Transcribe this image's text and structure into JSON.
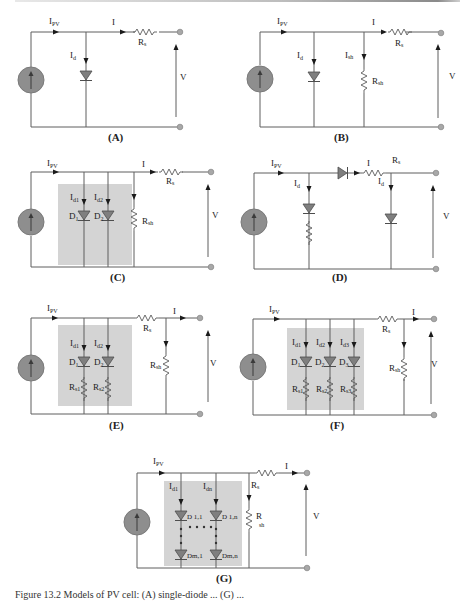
{
  "figure": {
    "panels": [
      {
        "id": "A",
        "caption": "(A)",
        "labels": {
          "ipv": "I",
          "ipv_sub": "PV",
          "i": "I",
          "id": "I",
          "id_sub": "d",
          "rs": "R",
          "rs_sub": "s",
          "v": "V"
        }
      },
      {
        "id": "B",
        "caption": "(B)",
        "labels": {
          "ipv": "I",
          "ipv_sub": "PV",
          "i": "I",
          "id": "I",
          "id_sub": "d",
          "ish": "I",
          "ish_sub": "sh",
          "rs": "R",
          "rs_sub": "s",
          "rsh": "R",
          "rsh_sub": "sh",
          "v": "V"
        }
      },
      {
        "id": "C",
        "caption": "(C)",
        "labels": {
          "ipv": "I",
          "ipv_sub": "PV",
          "i": "I",
          "id1": "I",
          "id1_sub": "d1",
          "id2": "I",
          "id2_sub": "d2",
          "d1": "D",
          "d1_sub": "1",
          "d2": "D",
          "d2_sub": "2",
          "rs": "R",
          "rs_sub": "s",
          "rsh": "R",
          "rsh_sub": "sh",
          "v": "V"
        }
      },
      {
        "id": "D",
        "caption": "(D)",
        "labels": {
          "ipv": "I",
          "ipv_sub": "PV",
          "i": "I",
          "id": "I",
          "id_sub": "d",
          "id_b": "I",
          "id_b_sub": "d",
          "rs": "R",
          "rs_sub": "s",
          "v": "V"
        }
      },
      {
        "id": "E",
        "caption": "(E)",
        "labels": {
          "ipv": "I",
          "ipv_sub": "PV",
          "i": "I",
          "id1": "I",
          "id1_sub": "d1",
          "id2": "I",
          "id2_sub": "d2",
          "d1": "D",
          "d1_sub": "1",
          "d2": "D",
          "d2_sub": "2",
          "rs1": "R",
          "rs1_sub": "s1",
          "rs2": "R",
          "rs2_sub": "s2",
          "rs": "R",
          "rs_sub": "s",
          "rsh": "R",
          "rsh_sub": "sh",
          "v": "V"
        }
      },
      {
        "id": "F",
        "caption": "(F)",
        "labels": {
          "ipv": "I",
          "ipv_sub": "PV",
          "i": "I",
          "id1": "I",
          "id1_sub": "d1",
          "id2": "I",
          "id2_sub": "d2",
          "id3": "I",
          "id3_sub": "d3",
          "d1": "D",
          "d1_sub": "1",
          "d2": "D",
          "d2_sub": "2",
          "d3": "D",
          "d3_sub": "3",
          "rs1": "R",
          "rs1_sub": "s1",
          "rs2": "R",
          "rs2_sub": "s2",
          "rs3": "R",
          "rs3_sub": "s3",
          "rs": "R",
          "rs_sub": "s",
          "rsh": "R",
          "rsh_sub": "sh",
          "v": "V"
        }
      },
      {
        "id": "G",
        "caption": "(G)",
        "labels": {
          "ipv": "I",
          "ipv_sub": "PV",
          "i": "I",
          "id1": "I",
          "id1_sub": "d1",
          "idn": "I",
          "idn_sub": "dn",
          "d11": "D 1,1",
          "d1n": "D 1,n",
          "dm1": "Dm,1",
          "dmn": "Dm,n",
          "rs": "R",
          "rs_sub": "s",
          "rsh": "R",
          "rsh_sub": "sh",
          "v": "V"
        }
      }
    ],
    "caption_text": "Figure 13.2  Models of PV cell: (A) single-diode ... (G) ..."
  }
}
